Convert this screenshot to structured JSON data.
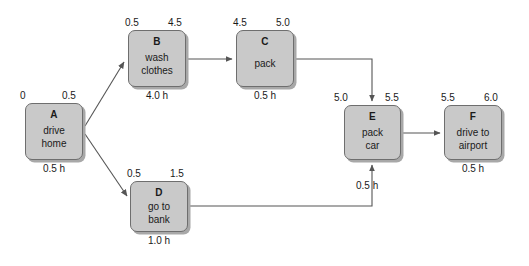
{
  "diagram": {
    "type": "activity-on-node network",
    "background_color": "#ffffff",
    "node_fill_color": "#c9c9c9",
    "node_border_color": "#6e6e6e",
    "edge_color": "#555555",
    "text_color": "#1a1a1a"
  },
  "nodes": [
    {
      "id": "A",
      "name": "drive\nhome",
      "duration": "0.5 h",
      "early_start": "0",
      "early_finish": "0.5",
      "x": 25,
      "y": 103,
      "w": 58,
      "h": 57
    },
    {
      "id": "B",
      "name": "wash\nclothes",
      "duration": "4.0 h",
      "early_start": "0.5",
      "early_finish": "4.5",
      "x": 128,
      "y": 30,
      "w": 58,
      "h": 57
    },
    {
      "id": "C",
      "name": "pack",
      "duration": "0.5 h",
      "early_start": "4.5",
      "early_finish": "5.0",
      "x": 236,
      "y": 30,
      "w": 58,
      "h": 57
    },
    {
      "id": "D",
      "name": "go to\nbank",
      "duration": "1.0 h",
      "early_start": "0.5",
      "early_finish": "1.5",
      "x": 130,
      "y": 181,
      "w": 58,
      "h": 51
    },
    {
      "id": "E",
      "name": "pack\ncar",
      "duration": "0.5 h",
      "early_start": "5.0",
      "early_finish": "5.5",
      "x": 344,
      "y": 105,
      "w": 57,
      "h": 55
    },
    {
      "id": "F",
      "name": "drive to\nairport",
      "duration": "0.5 h",
      "early_start": "5.5",
      "early_finish": "6.0",
      "x": 444,
      "y": 105,
      "w": 58,
      "h": 55
    }
  ],
  "edges": [
    {
      "from": "A",
      "to": "B",
      "style": "diagonal-up"
    },
    {
      "from": "A",
      "to": "D",
      "style": "diagonal-down"
    },
    {
      "from": "B",
      "to": "C",
      "style": "straight-right"
    },
    {
      "from": "C",
      "to": "E",
      "style": "right-then-down"
    },
    {
      "from": "D",
      "to": "E",
      "style": "right-then-up"
    },
    {
      "from": "E",
      "to": "F",
      "style": "straight-right"
    }
  ]
}
